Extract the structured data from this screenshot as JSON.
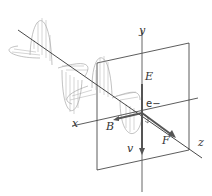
{
  "diagram": {
    "type": "electromagnetic-wave-force-on-electron",
    "labels": {
      "y_axis": "y",
      "x_axis": "x",
      "z_axis": "z",
      "electric_field": "E",
      "magnetic_field": "B",
      "electron": "e−",
      "velocity": "v",
      "force": "F"
    },
    "colors": {
      "line": "#333333",
      "wave": "#888888",
      "vector": "#555555",
      "background": "#ffffff"
    }
  }
}
